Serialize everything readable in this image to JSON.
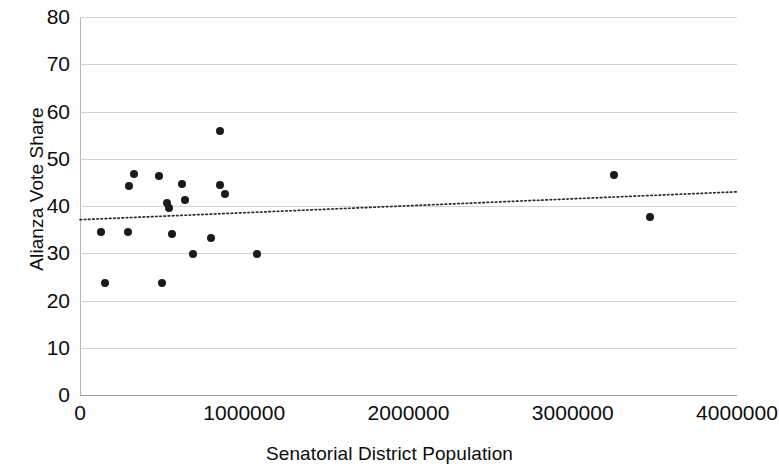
{
  "chart_data": {
    "type": "scatter",
    "title": "",
    "xlabel": "Senatorial District Population",
    "ylabel": "Alianza Vote Share",
    "xlim": [
      0,
      4000000
    ],
    "ylim": [
      0,
      80
    ],
    "xticks": [
      0,
      1000000,
      2000000,
      3000000,
      4000000
    ],
    "xtick_labels": [
      "0",
      "1000000",
      "2000000",
      "3000000",
      "4000000"
    ],
    "yticks": [
      0,
      10,
      20,
      30,
      40,
      50,
      60,
      70,
      80
    ],
    "ytick_labels": [
      "0",
      "10",
      "20",
      "30",
      "40",
      "50",
      "60",
      "70",
      "80"
    ],
    "grid": "horizontal",
    "legend": "none",
    "marker_color": "#1a1a1a",
    "gridline_color": "#d2d2d2",
    "points": [
      {
        "x": 130000,
        "y": 34.5
      },
      {
        "x": 155000,
        "y": 23.8
      },
      {
        "x": 290000,
        "y": 34.5
      },
      {
        "x": 300000,
        "y": 44.3
      },
      {
        "x": 330000,
        "y": 46.8
      },
      {
        "x": 480000,
        "y": 46.3
      },
      {
        "x": 500000,
        "y": 23.6
      },
      {
        "x": 530000,
        "y": 40.6
      },
      {
        "x": 540000,
        "y": 39.6
      },
      {
        "x": 560000,
        "y": 34.0
      },
      {
        "x": 620000,
        "y": 44.6
      },
      {
        "x": 640000,
        "y": 41.3
      },
      {
        "x": 690000,
        "y": 29.9
      },
      {
        "x": 800000,
        "y": 33.3
      },
      {
        "x": 850000,
        "y": 44.4
      },
      {
        "x": 855000,
        "y": 55.8
      },
      {
        "x": 880000,
        "y": 42.6
      },
      {
        "x": 1080000,
        "y": 29.8
      },
      {
        "x": 3250000,
        "y": 46.6
      },
      {
        "x": 3470000,
        "y": 37.6
      }
    ],
    "trendline": {
      "type": "linear",
      "style": "dotted",
      "color": "#2b2b2b",
      "x_start": 0,
      "y_start": 37.1,
      "x_end": 4000000,
      "y_end": 43.0
    }
  }
}
